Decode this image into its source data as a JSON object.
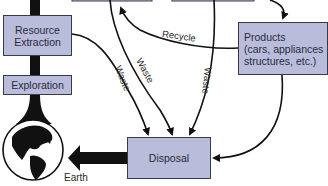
{
  "diagram": {
    "nodes": {
      "resource_extraction": {
        "label": "Resource\nExtraction"
      },
      "exploration": {
        "label": "Exploration"
      },
      "products": {
        "line1": "Products",
        "line2": "(cars, appliances",
        "line3": "structures, etc.)"
      },
      "disposal": {
        "label": "Disposal"
      },
      "earth": {
        "label": "Earth"
      }
    },
    "edges": {
      "recycle": {
        "label": "Recycle",
        "from": "products",
        "to": "top-box"
      },
      "waste_1": {
        "label": "Waste",
        "from": "resource_extraction",
        "to": "disposal"
      },
      "waste_2": {
        "label": "Waste",
        "from": "top-box",
        "to": "disposal"
      },
      "waste_3": {
        "label": "Waste",
        "from": "top-box",
        "to": "disposal"
      },
      "products_to_disposal": {
        "label": "",
        "from": "products",
        "to": "disposal"
      },
      "disposal_to_earth": {
        "label": "",
        "from": "disposal",
        "to": "earth"
      }
    },
    "colors": {
      "box_fill": "#b9bddb",
      "box_border": "#3a3a4a",
      "line": "#111111"
    }
  }
}
